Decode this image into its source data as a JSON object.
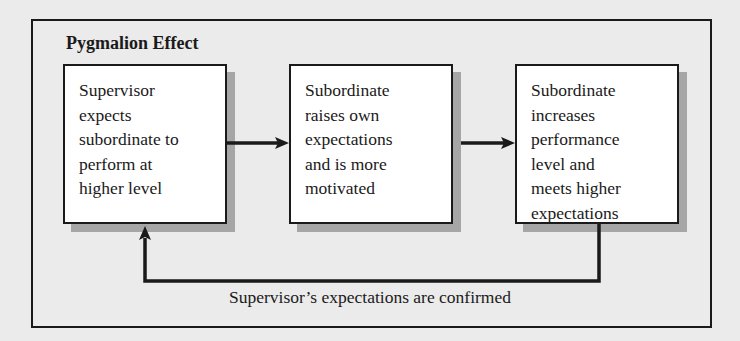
{
  "figure": {
    "title": "Pygmalion Effect",
    "steps": [
      {
        "label": "Supervisor\nexpects\nsubordinate to\nperform at\nhigher level"
      },
      {
        "label": "Subordinate\nraises own\nexpectations\nand is more\nmotivated"
      },
      {
        "label": "Subordinate\nincreases\nperformance\nlevel and\nmeets higher\nexpectations"
      }
    ],
    "feedback_label": "Supervisor’s expectations are confirmed",
    "colors": {
      "background": "#ebebeb",
      "box_fill": "#ffffff",
      "stroke": "#1a1a1a",
      "shadow": "#a6a6a6"
    }
  }
}
